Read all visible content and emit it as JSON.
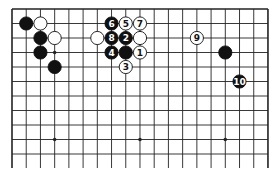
{
  "diagram": {
    "type": "go-board-fragment",
    "board_size_columns": 19,
    "visible_rows": 12,
    "edges": {
      "top": true,
      "left": true,
      "right": true,
      "bottom": false
    },
    "colors": {
      "background": "#ffffff",
      "line": "#222222",
      "black": "#111111",
      "white": "#ffffff"
    },
    "star_points": [
      {
        "col": 3,
        "row": 9
      },
      {
        "col": 9,
        "row": 9
      },
      {
        "col": 15,
        "row": 9
      },
      {
        "col": 3,
        "row": 3
      }
    ],
    "stones": [
      {
        "col": 1,
        "row": 1,
        "color": "black",
        "label": ""
      },
      {
        "col": 2,
        "row": 1,
        "color": "white",
        "label": ""
      },
      {
        "col": 2,
        "row": 2,
        "color": "black",
        "label": ""
      },
      {
        "col": 3,
        "row": 2,
        "color": "white",
        "label": ""
      },
      {
        "col": 2,
        "row": 3,
        "color": "black",
        "label": ""
      },
      {
        "col": 3,
        "row": 4,
        "color": "black",
        "label": ""
      },
      {
        "col": 7,
        "row": 1,
        "color": "black",
        "label": "6"
      },
      {
        "col": 8,
        "row": 1,
        "color": "white",
        "label": "5"
      },
      {
        "col": 9,
        "row": 1,
        "color": "white",
        "label": "7"
      },
      {
        "col": 6,
        "row": 2,
        "color": "white",
        "label": ""
      },
      {
        "col": 7,
        "row": 2,
        "color": "black",
        "label": "8"
      },
      {
        "col": 8,
        "row": 2,
        "color": "black",
        "label": "2"
      },
      {
        "col": 9,
        "row": 2,
        "color": "white",
        "label": ""
      },
      {
        "col": 7,
        "row": 3,
        "color": "black",
        "label": "4"
      },
      {
        "col": 8,
        "row": 3,
        "color": "black",
        "label": ""
      },
      {
        "col": 9,
        "row": 3,
        "color": "white",
        "label": "1"
      },
      {
        "col": 8,
        "row": 4,
        "color": "white",
        "label": "3"
      },
      {
        "col": 13,
        "row": 2,
        "color": "white",
        "label": "9"
      },
      {
        "col": 15,
        "row": 3,
        "color": "black",
        "label": ""
      },
      {
        "col": 16,
        "row": 5,
        "color": "black",
        "label": "10"
      }
    ]
  }
}
